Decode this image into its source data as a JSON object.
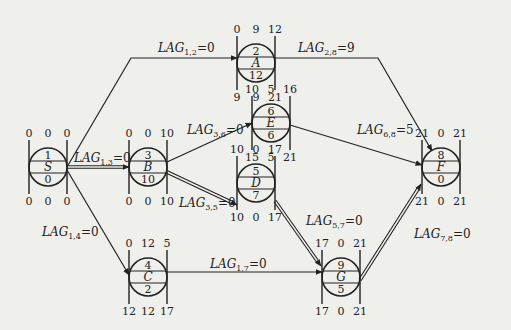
{
  "diagram": {
    "type": "single-code network (precedence diagram) with LAG values",
    "nodes": [
      {
        "id": "S",
        "code": "1",
        "name": "S",
        "duration": "0",
        "top": [
          "0",
          "0",
          "0"
        ],
        "bottom": [
          "0",
          "0",
          "0"
        ],
        "cx": 48,
        "cy": 167
      },
      {
        "id": "A",
        "code": "2",
        "name": "A",
        "duration": "12",
        "top": [
          "0",
          "9",
          "12"
        ],
        "bottom": [
          "9",
          "9",
          "21"
        ],
        "cx": 256,
        "cy": 63
      },
      {
        "id": "B",
        "code": "3",
        "name": "B",
        "duration": "10",
        "top": [
          "0",
          "0",
          "10"
        ],
        "bottom": [
          "0",
          "0",
          "10"
        ],
        "cx": 148,
        "cy": 167
      },
      {
        "id": "C",
        "code": "4",
        "name": "C",
        "duration": "2",
        "top": [
          "0",
          "12",
          "5"
        ],
        "bottom": [
          "12",
          "12",
          "17"
        ],
        "cx": 148,
        "cy": 277
      },
      {
        "id": "D",
        "code": "5",
        "name": "D",
        "duration": "7",
        "top": [
          "10",
          "0",
          "17"
        ],
        "bottom": [
          "10",
          "0",
          "17"
        ],
        "cx": 256,
        "cy": 183
      },
      {
        "id": "E",
        "code": "6",
        "name": "E",
        "duration": "6",
        "top": [
          "10",
          "5",
          "16"
        ],
        "bottom": [
          "15",
          "5",
          "21"
        ],
        "cx": 271,
        "cy": 123
      },
      {
        "id": "G",
        "code": "9",
        "name": "G",
        "duration": "5",
        "top": [
          "17",
          "0",
          "21"
        ],
        "bottom": [
          "17",
          "0",
          "21"
        ],
        "cx": 341,
        "cy": 277
      },
      {
        "id": "F",
        "code": "8",
        "name": "F",
        "duration": "0",
        "top": [
          "21",
          "0",
          "21"
        ],
        "bottom": [
          "21",
          "0",
          "21"
        ],
        "cx": 441,
        "cy": 167
      }
    ],
    "edges": [
      {
        "from": "S",
        "to": "A",
        "label_sub": "1,2",
        "label_val": "0",
        "critical": false
      },
      {
        "from": "A",
        "to": "F",
        "label_sub": "2,8",
        "label_val": "9",
        "critical": false
      },
      {
        "from": "S",
        "to": "B",
        "label_sub": "1,3",
        "label_val": "0",
        "critical": true
      },
      {
        "from": "B",
        "to": "E",
        "label_sub": "3,6",
        "label_val": "0",
        "critical": false
      },
      {
        "from": "E",
        "to": "F",
        "label_sub": "6,8",
        "label_val": "5",
        "critical": false
      },
      {
        "from": "B",
        "to": "D",
        "label_sub": "3,5",
        "label_val": "0",
        "critical": true
      },
      {
        "from": "D",
        "to": "G",
        "label_sub": "5,7",
        "label_val": "0",
        "critical": true
      },
      {
        "from": "S",
        "to": "C",
        "label_sub": "1,4",
        "label_val": "0",
        "critical": false
      },
      {
        "from": "C",
        "to": "G",
        "label_sub": "1,7",
        "label_val": "0",
        "critical": false
      },
      {
        "from": "G",
        "to": "F",
        "label_sub": "7,8",
        "label_val": "0",
        "critical": true
      }
    ],
    "lag_prefix": "LAG",
    "equals": "="
  }
}
